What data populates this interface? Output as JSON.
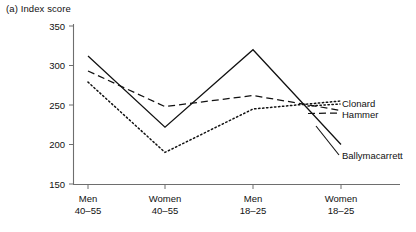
{
  "figure": {
    "label": "(a)",
    "title": "(a) Index score"
  },
  "chart_data": {
    "type": "line",
    "title": "(a) Index score",
    "xlabel": "",
    "ylabel": "Index score",
    "ylim": [
      150,
      350
    ],
    "yticks": [
      150,
      200,
      250,
      300,
      350
    ],
    "grid": false,
    "legend_position": "right-inline",
    "categories": [
      "Men 40–55",
      "Women 40–55",
      "Men 18–25",
      "Women 18–25"
    ],
    "category_lines": [
      {
        "top": "Men",
        "bottom": "40–55"
      },
      {
        "top": "Women",
        "bottom": "40–55"
      },
      {
        "top": "Men",
        "bottom": "18–25"
      },
      {
        "top": "Women",
        "bottom": "18–25"
      }
    ],
    "series": [
      {
        "name": "Ballymacarrett",
        "style": "solid",
        "values": [
          312,
          222,
          320,
          200
        ]
      },
      {
        "name": "Hammer",
        "style": "dashed",
        "values": [
          293,
          248,
          262,
          243
        ]
      },
      {
        "name": "Clonard",
        "style": "dotted",
        "values": [
          279,
          190,
          245,
          255
        ]
      }
    ]
  },
  "legend": {
    "clonard": "Clonard",
    "hammer": "Hammer",
    "ballymacarrett": "Ballymacarrett"
  },
  "axis": {
    "ytick_150": "150",
    "ytick_200": "200",
    "ytick_250": "250",
    "ytick_300": "300",
    "ytick_350": "350",
    "x1_top": "Men",
    "x1_bottom": "40–55",
    "x2_top": "Women",
    "x2_bottom": "40–55",
    "x3_top": "Men",
    "x3_bottom": "18–25",
    "x4_top": "Women",
    "x4_bottom": "18–25"
  }
}
